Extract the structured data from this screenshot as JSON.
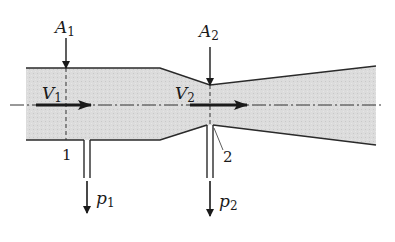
{
  "diagram": {
    "colors": {
      "fluid_fill": "#d9d9d9",
      "wall": "#2a2a2a",
      "arrow": "#1a1a1a",
      "centerline": "#333333"
    },
    "labels": {
      "area_1": {
        "base": "A",
        "sub": "1"
      },
      "area_2": {
        "base": "A",
        "sub": "2"
      },
      "velocity_1": {
        "base": "V",
        "sub": "1"
      },
      "velocity_2": {
        "base": "V",
        "sub": "2"
      },
      "pressure_1": {
        "base": "p",
        "sub": "1"
      },
      "pressure_2": {
        "base": "p",
        "sub": "2"
      },
      "section_1": "1",
      "section_2": "2"
    }
  }
}
